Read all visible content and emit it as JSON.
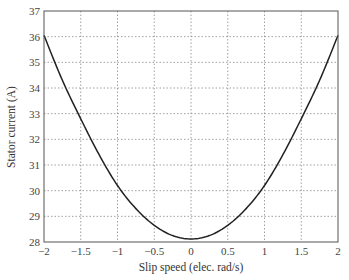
{
  "chart_data": {
    "type": "line",
    "title": "",
    "xlabel": "Slip speed (elec. rad/s)",
    "ylabel": "Stator current (A)",
    "xlim": [
      -2,
      2
    ],
    "ylim": [
      28,
      37
    ],
    "xticks": [
      "-2",
      "-1.5",
      "-1",
      "-0.5",
      "0",
      "0.5",
      "1",
      "1.5",
      "2"
    ],
    "yticks": [
      "28",
      "29",
      "30",
      "31",
      "32",
      "33",
      "34",
      "35",
      "36",
      "37"
    ],
    "grid": true,
    "legend": null,
    "series": [
      {
        "name": "Stator current",
        "x": [
          -2,
          -1.75,
          -1.5,
          -1.25,
          -1,
          -0.75,
          -0.5,
          -0.25,
          0,
          0.25,
          0.5,
          0.75,
          1,
          1.25,
          1.5,
          1.75,
          2
        ],
        "y": [
          36.05,
          34.3,
          32.8,
          31.4,
          30.2,
          29.3,
          28.65,
          28.25,
          28.12,
          28.25,
          28.65,
          29.3,
          30.2,
          31.4,
          32.8,
          34.3,
          36.05
        ]
      }
    ]
  },
  "colors": {
    "line": "#222222",
    "grid": "#888888",
    "axes": "#555555"
  }
}
